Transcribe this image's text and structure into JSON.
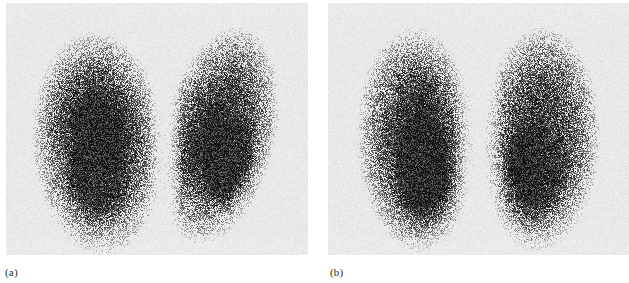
{
  "figure": {
    "type": "nuclear-medicine-scintigraphy",
    "modality": "lung perfusion scintigram",
    "panels": [
      {
        "id": "a",
        "label": "(a)",
        "background_color": "#e8e8e6",
        "description": "Posterior lung scan showing two lung fields with dense radiotracer uptake; left field upright and rounded, right field tilted with an indentation along its medial border"
      },
      {
        "id": "b",
        "label": "(b)",
        "background_color": "#e9e9e7",
        "description": "Posterior lung scan showing two symmetric lung fields with uniform dense radiotracer uptake separated by a clear mediastinal gap"
      }
    ]
  },
  "colors": {
    "page_background": "#ffffff",
    "panel_background": "#e8e8e6",
    "speckle_dark": "#111111",
    "label_text": "#2a2a2a"
  },
  "chart_data": {
    "type": "heatmap",
    "title": "",
    "xlabel": "",
    "ylabel": "",
    "panels": [
      {
        "name": "(a)",
        "lobes": [
          {
            "name": "left-lung-field-a",
            "cx": 92,
            "cy": 140,
            "rx": 58,
            "ry": 98,
            "rotation": -4,
            "core_cx": 92,
            "core_cy": 165,
            "core_rx": 40,
            "core_ry": 62,
            "intensity": 1.0
          },
          {
            "name": "right-lung-field-a",
            "cx": 212,
            "cy": 132,
            "rx": 50,
            "ry": 96,
            "rotation": 13,
            "core_cx": 220,
            "core_cy": 150,
            "core_rx": 32,
            "core_ry": 62,
            "intensity": 0.98
          }
        ],
        "mediastinal_gap_x": [
          148,
          170
        ]
      },
      {
        "name": "(b)",
        "lobes": [
          {
            "name": "left-lung-field-b",
            "cx": 88,
            "cy": 136,
            "rx": 52,
            "ry": 98,
            "rotation": -2,
            "core_cx": 92,
            "core_cy": 160,
            "core_rx": 38,
            "core_ry": 66,
            "intensity": 1.0
          },
          {
            "name": "right-lung-field-b",
            "cx": 212,
            "cy": 136,
            "rx": 52,
            "ry": 98,
            "rotation": 2,
            "core_cx": 208,
            "core_cy": 160,
            "core_rx": 38,
            "core_ry": 66,
            "intensity": 1.0
          }
        ],
        "mediastinal_gap_x": [
          134,
          166
        ]
      }
    ]
  }
}
